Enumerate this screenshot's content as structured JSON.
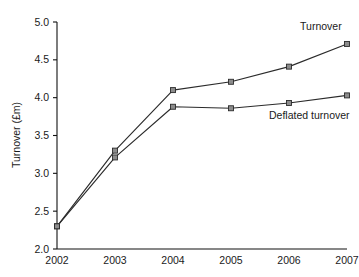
{
  "chart_data": {
    "type": "line",
    "title": "",
    "xlabel": "",
    "ylabel": "Turnover (£m)",
    "categories": [
      "2002",
      "2003",
      "2004",
      "2005",
      "2006",
      "2007"
    ],
    "x": [
      2002,
      2003,
      2004,
      2005,
      2006,
      2007
    ],
    "xlim": [
      2002,
      2007
    ],
    "ylim": [
      2.0,
      5.0
    ],
    "y_ticks": [
      "2.0",
      "2.5",
      "3.0",
      "3.5",
      "4.0",
      "4.5",
      "5.0"
    ],
    "y_tick_values": [
      2.0,
      2.5,
      3.0,
      3.5,
      4.0,
      4.5,
      5.0
    ],
    "grid": false,
    "legend_position": "inline-annotations",
    "series": [
      {
        "name": "Turnover",
        "values": [
          2.3,
          3.3,
          4.1,
          4.21,
          4.41,
          4.71
        ],
        "color": "#2b2b2b",
        "marker": "square",
        "marker_fill": "#8c8c8c",
        "label_text": "Turnover"
      },
      {
        "name": "Deflated turnover",
        "values": [
          2.3,
          3.21,
          3.88,
          3.86,
          3.93,
          4.03
        ],
        "color": "#2b2b2b",
        "marker": "square",
        "marker_fill": "#8c8c8c",
        "label_text": "Deflated turnover"
      }
    ],
    "annotations": [
      {
        "text": "Turnover",
        "x": 2006.55,
        "y": 4.9
      },
      {
        "text": "Deflated turnover",
        "x": 2006.35,
        "y": 3.72
      }
    ],
    "axis_color": "#111111",
    "background": "#ffffff"
  }
}
